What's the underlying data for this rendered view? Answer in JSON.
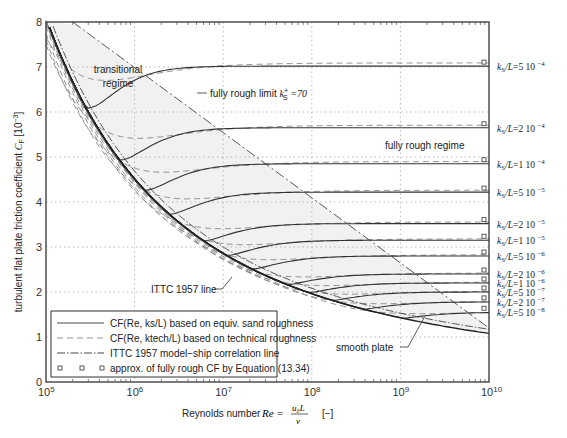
{
  "chart_data": {
    "type": "line",
    "title": "",
    "xlabel": "Reynolds number",
    "xlabel_formula": "Re = u0 L / ν",
    "xlabel_unit": "[−]",
    "ylabel": "turbulent flat plate friction coefficient",
    "ylabel_symbol": "C_F",
    "ylabel_unit": "[10^-3]",
    "xscale": "log",
    "xlim": [
      100000,
      10000000000
    ],
    "ylim": [
      0,
      8
    ],
    "x_ticks": [
      "10^5",
      "10^6",
      "10^7",
      "10^8",
      "10^9",
      "10^10"
    ],
    "y_ticks": [
      0,
      1,
      2,
      3,
      4,
      5,
      6,
      7,
      8
    ],
    "grid": true,
    "series": [
      {
        "name": "ks/L=5 10^-4",
        "fully_rough_CF": 7.02
      },
      {
        "name": "ks/L=2 10^-4",
        "fully_rough_CF": 5.65
      },
      {
        "name": "ks/L=1 10^-4",
        "fully_rough_CF": 4.85
      },
      {
        "name": "ks/L=5 10^-5",
        "fully_rough_CF": 4.22
      },
      {
        "name": "ks/L=2 10^-5",
        "fully_rough_CF": 3.52
      },
      {
        "name": "ks/L=1 10^-5",
        "fully_rough_CF": 3.15
      },
      {
        "name": "ks/L=5 10^-6",
        "fully_rough_CF": 2.8
      },
      {
        "name": "ks/L=2 10^-6",
        "fully_rough_CF": 2.4
      },
      {
        "name": "ks/L=1 10^-6",
        "fully_rough_CF": 2.2
      },
      {
        "name": "ks/L=5 10^-7",
        "fully_rough_CF": 2.0
      },
      {
        "name": "ks/L=2 10^-7",
        "fully_rough_CF": 1.78
      },
      {
        "name": "ks/L=5 10^-8",
        "fully_rough_CF": 1.55
      }
    ],
    "reference_lines": [
      {
        "name": "smooth plate",
        "CF_at": {
          "1e5": 7.4,
          "1e6": 4.45,
          "1e7": 2.95,
          "1e8": 2.07,
          "1e9": 1.54,
          "1e10": 1.18
        }
      },
      {
        "name": "ITTC 1957 line",
        "CF_at": {
          "1e5": 8.33,
          "1e6": 4.69,
          "1e7": 3.0,
          "1e8": 2.08,
          "1e9": 1.54,
          "1e10": 1.18
        }
      },
      {
        "name": "fully rough limit ks+ = 70",
        "from": [
          200000,
          8.0
        ],
        "to": [
          10000000000,
          1.2
        ]
      }
    ],
    "annotations": [
      "transitional regime",
      "fully rough limit k_S+ =70",
      "fully rough regime",
      "ITTC 1957 line",
      "smooth plate"
    ],
    "legend": {
      "position": "lower-left",
      "entries": [
        {
          "style": "solid",
          "label": "C_F(Re, k_s/L) based on equiv. sand roughness"
        },
        {
          "style": "dashed",
          "label": "C_F(Re, k_tech/L) based on technical roughness"
        },
        {
          "style": "dash-dot",
          "label": "ITTC 1957 model−ship correlation line"
        },
        {
          "style": "square-markers",
          "label": "approx. of fully rough C_F by Equation (13.34)"
        }
      ]
    }
  },
  "labels": {
    "transitional": [
      "transitional",
      "regime"
    ],
    "fully_rough_limit": "fully rough limit",
    "fully_rough_regime": "fully rough regime",
    "ittc_line": "ITTC 1957 line",
    "smooth_plate": "smooth plate",
    "ylabel_text": "turbulent flat plate friction coefficient",
    "xlabel_text": "Reynolds number"
  }
}
